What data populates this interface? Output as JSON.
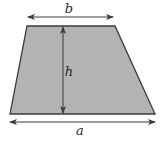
{
  "diagram": {
    "type": "trapezoid-dimensions",
    "colors": {
      "fill": "#b3b3b3",
      "stroke": "#3a3a3a",
      "arrow": "#3a3a3a",
      "text": "#2a2a2a",
      "background": "#ffffff"
    },
    "labels": {
      "top_base": "b",
      "height": "h",
      "bottom_base": "a"
    },
    "shape": {
      "vertices": [
        [
          27,
          26
        ],
        [
          115,
          26
        ],
        [
          155,
          114
        ],
        [
          10,
          114
        ]
      ]
    },
    "dimensions": [
      {
        "name": "b",
        "from": [
          28,
          17
        ],
        "to": [
          113,
          17
        ],
        "label_pos": [
          69,
          12
        ]
      },
      {
        "name": "h",
        "from": [
          63,
          27
        ],
        "to": [
          63,
          113
        ],
        "label_pos": [
          68,
          73
        ]
      },
      {
        "name": "a",
        "from": [
          10,
          122
        ],
        "to": [
          155,
          122
        ],
        "label_pos": [
          80,
          134
        ]
      }
    ]
  }
}
